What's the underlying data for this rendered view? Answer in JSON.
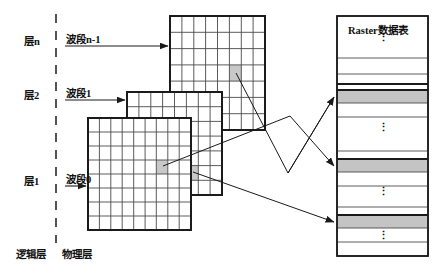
{
  "diagram": {
    "title_table": "Raster数据表",
    "footer": "逻辑层 物理层",
    "footer_logical": "逻辑层",
    "footer_physical": "物理层",
    "divider": "dashed-vertical-line",
    "rows": [
      {
        "layer_label": "层n",
        "band_label": "波段n-1"
      },
      {
        "layer_label": "层2",
        "band_label": "波段1"
      },
      {
        "layer_label": "层1",
        "band_label": "波段0"
      }
    ],
    "ellipsis": "⋮",
    "grids": [
      {
        "name": "layer-n-grid",
        "cols": 8,
        "rows": 7,
        "x": 170,
        "y": 16,
        "w": 95,
        "h": 114,
        "highlight": {
          "col": 5,
          "row": 3
        }
      },
      {
        "name": "layer-2-grid",
        "cols": 8,
        "rows": 7,
        "x": 127,
        "y": 92,
        "w": 95,
        "h": 103,
        "highlight": {
          "col": 5,
          "row": 5
        }
      },
      {
        "name": "layer-1-grid",
        "cols": 9,
        "rows": 8,
        "x": 88,
        "y": 118,
        "w": 103,
        "h": 112,
        "highlight": {
          "col": 6,
          "row": 4
        }
      }
    ],
    "table": {
      "x": 337,
      "y": 16,
      "w": 91,
      "h": 240,
      "rows": [
        {
          "type": "title"
        },
        {
          "type": "dots"
        },
        {
          "type": "blank"
        },
        {
          "type": "thick"
        },
        {
          "type": "shaded"
        },
        {
          "type": "blank"
        },
        {
          "type": "dots"
        },
        {
          "type": "shaded"
        },
        {
          "type": "blank"
        },
        {
          "type": "dots"
        },
        {
          "type": "shaded"
        },
        {
          "type": "blank"
        },
        {
          "type": "dots"
        }
      ]
    },
    "colors": {
      "stroke": "#1a1a1a",
      "grid_line": "#4a4a4a",
      "highlight_fill": "#c8c8c8",
      "shaded_row": "#c4c4c4",
      "background": "#ffffff"
    }
  }
}
